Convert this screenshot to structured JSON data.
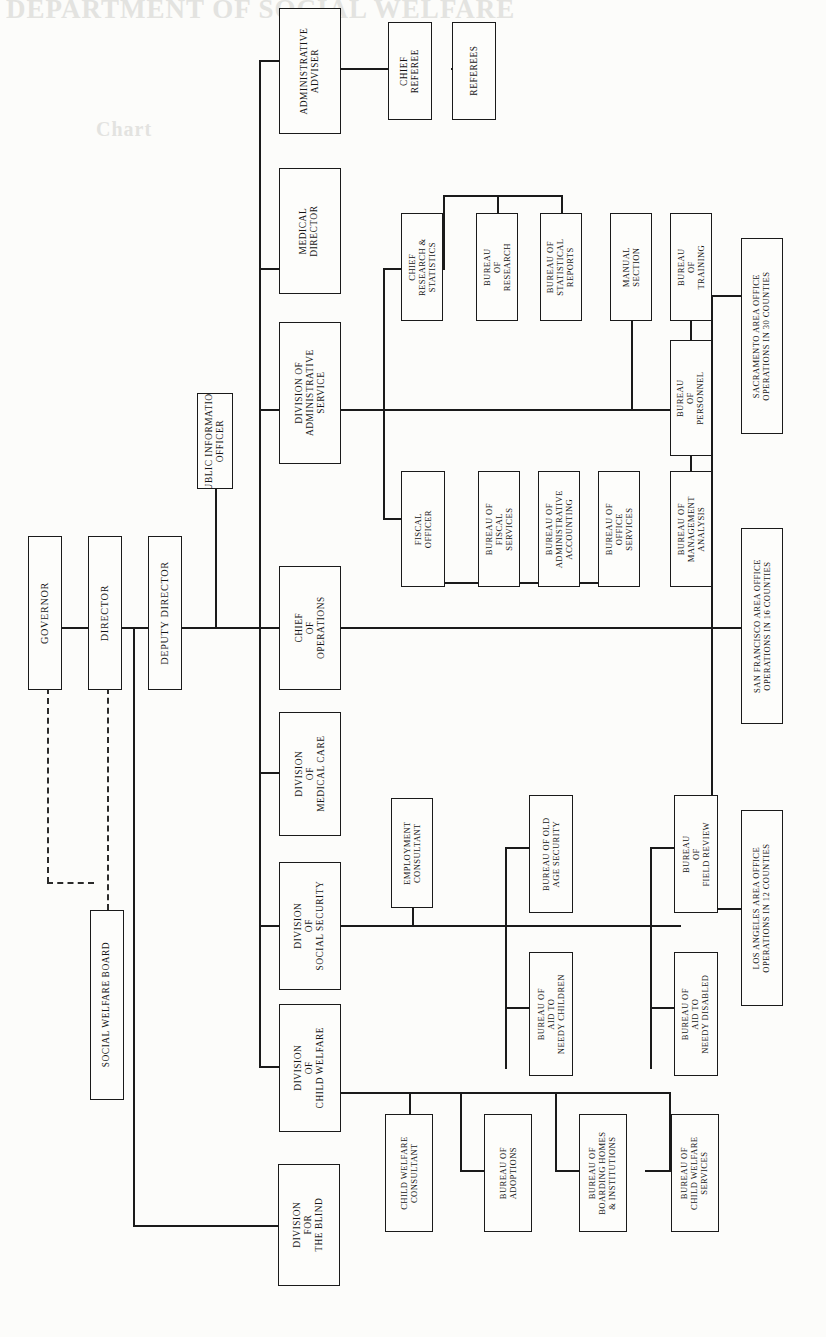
{
  "document": {
    "kind": "organization-chart",
    "orientation": "rotated-90-counterclockwise",
    "bleed_through_top": "DEPARTMENT OF SOCIAL WELFARE",
    "bleed_through_second": "Chart"
  },
  "colors": {
    "paper": "#fcfcfa",
    "ink": "#141414",
    "line": "#1a1a1a",
    "dashed_line": "#2a2a2a"
  },
  "nodes": {
    "governor": "GOVERNOR",
    "director": "DIRECTOR",
    "deputy_director": "DEPUTY DIRECTOR",
    "social_welfare_board": "SOCIAL WELFARE BOARD",
    "public_information_officer": "PUBLIC INFORMATION\nOFFICER",
    "administrative_adviser": "ADMINISTRATIVE\nADVISER",
    "chief_referee": "CHIEF\nREFEREE",
    "referees": "REFEREES",
    "medical_director": "MEDICAL\nDIRECTOR",
    "division_administrative_service": "DIVISION OF\nADMINISTRATIVE\nSERVICE",
    "chief_research_statistics": "CHIEF\nRESEARCH &\nSTATISTICS",
    "bureau_research": "BUREAU\nOF\nRESEARCH",
    "bureau_statistical_reports": "BUREAU OF\nSTATISTICAL\nREPORTS",
    "manual_section": "MANUAL\nSECTION",
    "bureau_training": "BUREAU\nOF\nTRAINING",
    "bureau_personnel": "BUREAU\nOF\nPERSONNEL",
    "fiscal_officer": "FISCAL\nOFFICER",
    "bureau_fiscal_services": "BUREAU OF\nFISCAL\nSERVICES",
    "bureau_administrative_accounting": "BUREAU OF\nADMINISTRATIVE\nACCOUNTING",
    "bureau_office_services": "BUREAU OF\nOFFICE\nSERVICES",
    "bureau_management_analysis": "BUREAU OF\nMANAGEMENT\nANALYSIS",
    "chief_of_operations": "CHIEF\nOF\nOPERATIONS",
    "division_medical_care": "DIVISION\nOF\nMEDICAL CARE",
    "division_social_security": "DIVISION\nOF\nSOCIAL SECURITY",
    "division_child_welfare": "DIVISION\nOF\nCHILD WELFARE",
    "division_for_the_blind": "DIVISION\nFOR\nTHE BLIND",
    "employment_consultant": "EMPLOYMENT\nCONSULTANT",
    "bureau_old_age_security": "BUREAU OF OLD\nAGE SECURITY",
    "bureau_aid_needy_children": "BUREAU OF\nAID TO\nNEEDY CHILDREN",
    "bureau_field_review": "BUREAU\nOF\nFIELD REVIEW",
    "bureau_aid_needy_disabled": "BUREAU OF\nAID TO\nNEEDY DISABLED",
    "child_welfare_consultant": "CHILD WELFARE\nCONSULTANT",
    "bureau_adoptions": "BUREAU OF\nADOPTIONS",
    "bureau_boarding_homes": "BUREAU OF\nBOARDING HOMES\n& INSTITUTIONS",
    "bureau_child_welfare_services": "BUREAU OF\nCHILD WELFARE\nSERVICES",
    "sacramento_area_office": "SACRAMENTO AREA OFFICE\nOPERATIONS IN 30 COUNTIES",
    "san_francisco_area_office": "SAN FRANCISCO AREA OFFICE\nOPERATIONS IN 16 COUNTIES",
    "los_angeles_area_office": "LOS ANGELES AREA OFFICE\nOPERATIONS IN 12 COUNTIES"
  }
}
